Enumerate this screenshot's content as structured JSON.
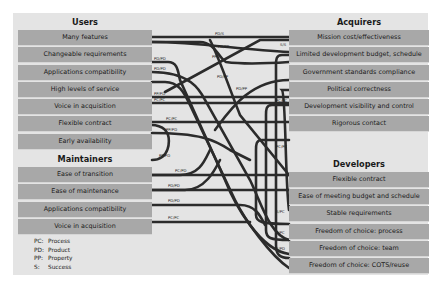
{
  "left": {
    "users": {
      "title": "Users",
      "items": [
        "Many features",
        "Changeable requirements",
        "Applications compatibility",
        "High levels of service",
        "Voice in acquisition",
        "Flexible contract",
        "Early availability"
      ]
    },
    "maintainers": {
      "title": "Maintainers",
      "items": [
        "Ease of transition",
        "Ease of maintenance",
        "Applications compatibility",
        "Voice in acquisition"
      ]
    }
  },
  "right": {
    "acquirers": {
      "title": "Acquirers",
      "items": [
        "Mission cost/effectiveness",
        "Limited development budget, schedule",
        "Government standards compliance",
        "Political correctness",
        "Development visibility and control",
        "Rigorous contact"
      ]
    },
    "developers": {
      "title": "Developers",
      "items": [
        "Flexible contract",
        "Ease of meeting budget and schedule",
        "Stable requirements",
        "Freedom of choice: process",
        "Freedom of choice: team",
        "Freedom of choice: COTS/reuse"
      ]
    }
  },
  "legend": [
    {
      "key": "PC:",
      "value": "Process"
    },
    {
      "key": "PD:",
      "value": "Product"
    },
    {
      "key": "PP:",
      "value": "Property"
    },
    {
      "key": "S:",
      "value": "Success"
    }
  ],
  "link_labels": [
    "PD/S",
    "PD/PP",
    "PP/S",
    "S/S",
    "PD/PP",
    "PD/PD",
    "PD/PP",
    "PP/PD",
    "PC/PC",
    "PC/PC",
    "PC/PC",
    "PP/PD",
    "PP/PD",
    "PC/PD",
    "PD/PD",
    "PD/PD",
    "PC/PC",
    "PC/PC",
    "S/PC",
    "S/PC",
    "S/PD"
  ],
  "colors": {
    "frame": "#e4e4e4",
    "row": "#a8a8a8",
    "line": "#2b2b2b"
  }
}
